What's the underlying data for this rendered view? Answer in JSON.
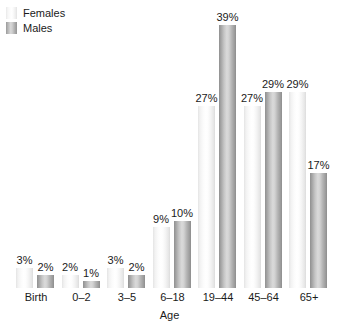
{
  "legend": {
    "position": "top-left",
    "items": [
      {
        "label": "Females",
        "swatch": "female-swatch",
        "color": "#f2f2f2"
      },
      {
        "label": "Males",
        "swatch": "male-swatch",
        "color": "#b0b0b0"
      }
    ]
  },
  "axis": {
    "x_title": "Age"
  },
  "chart_data": {
    "type": "bar",
    "title": "",
    "subtitle": "",
    "xlabel": "Age",
    "ylabel": "",
    "ylim": [
      0,
      39
    ],
    "grid": false,
    "legend_position": "top-left",
    "value_suffix": "%",
    "categories": [
      "Birth",
      "0–2",
      "3–5",
      "6–18",
      "19–44",
      "45–64",
      "65+"
    ],
    "series": [
      {
        "name": "Females",
        "values": [
          3,
          2,
          3,
          9,
          27,
          27,
          29
        ],
        "labels": [
          "3%",
          "2%",
          "3%",
          "9%",
          "27%",
          "27%",
          "29%"
        ]
      },
      {
        "name": "Males",
        "values": [
          2,
          1,
          2,
          10,
          39,
          29,
          17
        ],
        "labels": [
          "2%",
          "1%",
          "2%",
          "10%",
          "39%",
          "29%",
          "17%"
        ]
      }
    ]
  }
}
